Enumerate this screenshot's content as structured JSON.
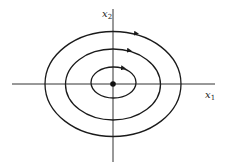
{
  "diagram": {
    "type": "phase-portrait",
    "equilibrium": "center",
    "colors": {
      "stroke": "#1a1a1a",
      "axis": "#333333",
      "background": "#ffffff"
    },
    "axes": {
      "x": {
        "label": "x",
        "subscript": "1"
      },
      "y": {
        "label": "x",
        "subscript": "2"
      }
    },
    "origin": {
      "cx": 113,
      "cy": 84
    },
    "orbits": [
      {
        "name": "inner",
        "rx": 22.5,
        "ry": 15.5,
        "direction": "clockwise"
      },
      {
        "name": "middle",
        "rx": 47.5,
        "ry": 35.5,
        "direction": "clockwise"
      },
      {
        "name": "outer",
        "rx": 68,
        "ry": 52.5,
        "direction": "clockwise"
      }
    ]
  }
}
